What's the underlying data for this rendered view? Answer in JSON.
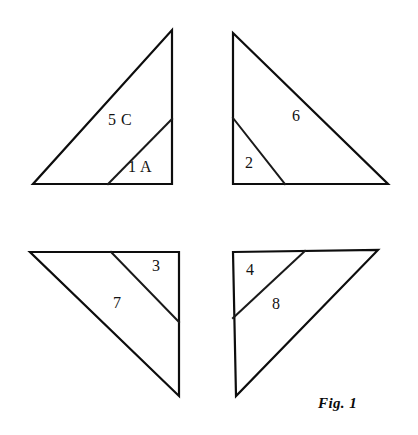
{
  "figure": {
    "caption": "Fig. 1",
    "caption_position": {
      "x": 318,
      "y": 396
    },
    "canvas": {
      "width": 418,
      "height": 435,
      "background": "#ffffff"
    },
    "ink_color": "#0d0d0d"
  },
  "shapes": [
    {
      "id": "triangle-top-left",
      "name": "top-left-triangle",
      "outline_points": "172,30 172,184 33,184",
      "cut_line": {
        "x1": 172,
        "y1": 119,
        "x2": 108,
        "y2": 184
      },
      "pieces": [
        {
          "label": "5 C",
          "x": 108,
          "y": 112
        },
        {
          "label": "1 A",
          "x": 128,
          "y": 159
        }
      ]
    },
    {
      "id": "triangle-top-right",
      "name": "top-right-triangle",
      "outline_points": "233,33 388,184 233,184",
      "cut_line": {
        "x1": 233,
        "y1": 118,
        "x2": 285,
        "y2": 184
      },
      "pieces": [
        {
          "label": "6",
          "x": 292,
          "y": 108
        },
        {
          "label": "2",
          "x": 245,
          "y": 155
        }
      ]
    },
    {
      "id": "triangle-bottom-left",
      "name": "bottom-left-triangle",
      "outline_points": "30,252 179,252 179,396",
      "cut_line": {
        "x1": 111,
        "y1": 252,
        "x2": 179,
        "y2": 322
      },
      "pieces": [
        {
          "label": "3",
          "x": 152,
          "y": 258
        },
        {
          "label": "7",
          "x": 113,
          "y": 295
        }
      ]
    },
    {
      "id": "triangle-bottom-right",
      "name": "bottom-right-triangle",
      "outline_points": "233,252 378,250 236,396",
      "cut_line": {
        "x1": 233,
        "y1": 318,
        "x2": 305,
        "y2": 251
      },
      "pieces": [
        {
          "label": "4",
          "x": 246,
          "y": 262
        },
        {
          "label": "8",
          "x": 272,
          "y": 296
        }
      ]
    }
  ],
  "labels": [
    {
      "text": "5 C",
      "x": 108,
      "y": 112,
      "shape": "triangle-top-left"
    },
    {
      "text": "1 A",
      "x": 128,
      "y": 159,
      "shape": "triangle-top-left"
    },
    {
      "text": "6",
      "x": 292,
      "y": 108,
      "shape": "triangle-top-right"
    },
    {
      "text": "2",
      "x": 245,
      "y": 155,
      "shape": "triangle-top-right"
    },
    {
      "text": "3",
      "x": 152,
      "y": 258,
      "shape": "triangle-bottom-left"
    },
    {
      "text": "7",
      "x": 113,
      "y": 295,
      "shape": "triangle-bottom-left"
    },
    {
      "text": "4",
      "x": 246,
      "y": 262,
      "shape": "triangle-bottom-right"
    },
    {
      "text": "8",
      "x": 272,
      "y": 296,
      "shape": "triangle-bottom-right"
    }
  ]
}
